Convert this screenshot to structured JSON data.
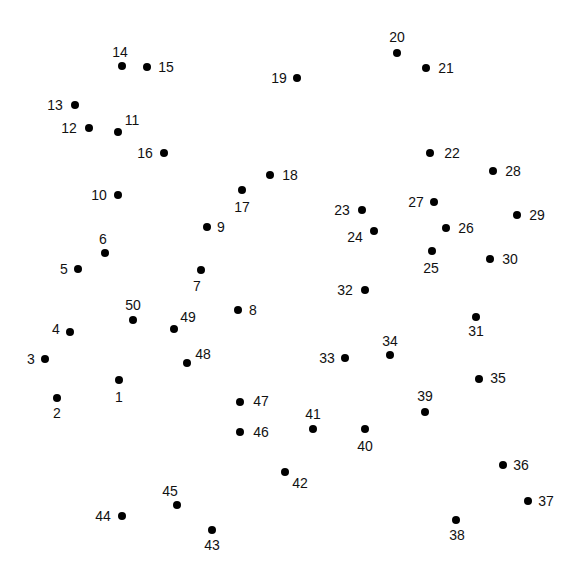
{
  "puzzle": {
    "type": "connect-the-dots",
    "dot_color": "#000000",
    "label_color": "#111111",
    "background": "#ffffff",
    "dots": [
      {
        "n": "1",
        "x": 119,
        "y": 380,
        "lx": 119,
        "ly": 397
      },
      {
        "n": "2",
        "x": 57,
        "y": 398,
        "lx": 57,
        "ly": 413
      },
      {
        "n": "3",
        "x": 45,
        "y": 359,
        "lx": 31,
        "ly": 359
      },
      {
        "n": "4",
        "x": 70,
        "y": 332,
        "lx": 56,
        "ly": 329
      },
      {
        "n": "5",
        "x": 78,
        "y": 269,
        "lx": 64,
        "ly": 269
      },
      {
        "n": "6",
        "x": 105,
        "y": 253,
        "lx": 103,
        "ly": 239
      },
      {
        "n": "7",
        "x": 201,
        "y": 270,
        "lx": 197,
        "ly": 286
      },
      {
        "n": "8",
        "x": 238,
        "y": 310,
        "lx": 253,
        "ly": 310
      },
      {
        "n": "9",
        "x": 207,
        "y": 227,
        "lx": 221,
        "ly": 227
      },
      {
        "n": "10",
        "x": 118,
        "y": 195,
        "lx": 99,
        "ly": 195
      },
      {
        "n": "11",
        "x": 118,
        "y": 132,
        "lx": 132,
        "ly": 120
      },
      {
        "n": "12",
        "x": 89,
        "y": 128,
        "lx": 69,
        "ly": 128
      },
      {
        "n": "13",
        "x": 75,
        "y": 105,
        "lx": 55,
        "ly": 105
      },
      {
        "n": "14",
        "x": 122,
        "y": 66,
        "lx": 120,
        "ly": 52
      },
      {
        "n": "15",
        "x": 147,
        "y": 67,
        "lx": 166,
        "ly": 67
      },
      {
        "n": "16",
        "x": 164,
        "y": 153,
        "lx": 145,
        "ly": 153
      },
      {
        "n": "17",
        "x": 242,
        "y": 190,
        "lx": 242,
        "ly": 207
      },
      {
        "n": "18",
        "x": 270,
        "y": 175,
        "lx": 290,
        "ly": 175
      },
      {
        "n": "19",
        "x": 297,
        "y": 78,
        "lx": 279,
        "ly": 78
      },
      {
        "n": "20",
        "x": 397,
        "y": 53,
        "lx": 397,
        "ly": 37
      },
      {
        "n": "21",
        "x": 426,
        "y": 68,
        "lx": 446,
        "ly": 68
      },
      {
        "n": "22",
        "x": 430,
        "y": 153,
        "lx": 452,
        "ly": 153
      },
      {
        "n": "23",
        "x": 362,
        "y": 210,
        "lx": 342,
        "ly": 210
      },
      {
        "n": "24",
        "x": 374,
        "y": 231,
        "lx": 355,
        "ly": 237
      },
      {
        "n": "25",
        "x": 432,
        "y": 251,
        "lx": 431,
        "ly": 268
      },
      {
        "n": "26",
        "x": 446,
        "y": 228,
        "lx": 466,
        "ly": 228
      },
      {
        "n": "27",
        "x": 434,
        "y": 202,
        "lx": 416,
        "ly": 202
      },
      {
        "n": "28",
        "x": 493,
        "y": 171,
        "lx": 513,
        "ly": 171
      },
      {
        "n": "29",
        "x": 517,
        "y": 215,
        "lx": 537,
        "ly": 215
      },
      {
        "n": "30",
        "x": 490,
        "y": 259,
        "lx": 510,
        "ly": 259
      },
      {
        "n": "31",
        "x": 476,
        "y": 317,
        "lx": 476,
        "ly": 331
      },
      {
        "n": "32",
        "x": 365,
        "y": 290,
        "lx": 345,
        "ly": 290
      },
      {
        "n": "33",
        "x": 345,
        "y": 358,
        "lx": 327,
        "ly": 358
      },
      {
        "n": "34",
        "x": 390,
        "y": 355,
        "lx": 390,
        "ly": 341
      },
      {
        "n": "35",
        "x": 479,
        "y": 379,
        "lx": 498,
        "ly": 378
      },
      {
        "n": "36",
        "x": 503,
        "y": 465,
        "lx": 521,
        "ly": 465
      },
      {
        "n": "37",
        "x": 528,
        "y": 501,
        "lx": 546,
        "ly": 501
      },
      {
        "n": "38",
        "x": 456,
        "y": 520,
        "lx": 457,
        "ly": 535
      },
      {
        "n": "39",
        "x": 425,
        "y": 412,
        "lx": 425,
        "ly": 396
      },
      {
        "n": "40",
        "x": 365,
        "y": 429,
        "lx": 365,
        "ly": 446
      },
      {
        "n": "41",
        "x": 313,
        "y": 429,
        "lx": 313,
        "ly": 414
      },
      {
        "n": "42",
        "x": 285,
        "y": 472,
        "lx": 300,
        "ly": 483
      },
      {
        "n": "43",
        "x": 212,
        "y": 530,
        "lx": 212,
        "ly": 545
      },
      {
        "n": "44",
        "x": 122,
        "y": 516,
        "lx": 103,
        "ly": 516
      },
      {
        "n": "45",
        "x": 177,
        "y": 505,
        "lx": 170,
        "ly": 491
      },
      {
        "n": "46",
        "x": 240,
        "y": 432,
        "lx": 261,
        "ly": 432
      },
      {
        "n": "47",
        "x": 240,
        "y": 402,
        "lx": 261,
        "ly": 401
      },
      {
        "n": "48",
        "x": 187,
        "y": 363,
        "lx": 203,
        "ly": 354
      },
      {
        "n": "49",
        "x": 174,
        "y": 329,
        "lx": 188,
        "ly": 317
      },
      {
        "n": "50",
        "x": 133,
        "y": 320,
        "lx": 133,
        "ly": 305
      }
    ]
  }
}
